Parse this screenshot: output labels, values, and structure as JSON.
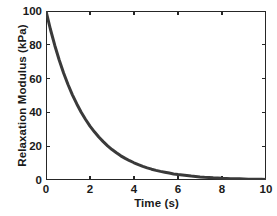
{
  "chart_data": {
    "type": "line",
    "title": "",
    "subtitle": "",
    "xlabel": "Time (s)",
    "ylabel": "Relaxation Modulus (kPa)",
    "xlim": [
      0,
      10
    ],
    "ylim": [
      0,
      100
    ],
    "xticks": [
      0,
      2,
      4,
      6,
      8,
      10
    ],
    "yticks": [
      0,
      20,
      40,
      60,
      80,
      100
    ],
    "xtick_labels": [
      "0",
      "2",
      "4",
      "6",
      "8",
      "10"
    ],
    "ytick_labels": [
      "0",
      "20",
      "40",
      "60",
      "80",
      "100"
    ],
    "grid": false,
    "legend": null,
    "legend_position": "none",
    "annotations": [],
    "series": [
      {
        "name": "Relaxation Modulus",
        "color": "#3a3a3a",
        "line_width": 3.0,
        "style": "solid",
        "x": [
          0.0,
          0.2,
          0.4,
          0.6,
          0.8,
          1.0,
          1.2,
          1.4,
          1.6,
          1.8,
          2.0,
          2.2,
          2.4,
          2.6,
          2.8,
          3.0,
          3.2,
          3.4,
          3.6,
          3.8,
          4.0,
          4.2,
          4.4,
          4.6,
          4.8,
          5.0,
          5.2,
          5.4,
          5.6,
          5.8,
          6.0,
          6.2,
          6.4,
          6.6,
          6.8,
          7.0,
          7.2,
          7.4,
          7.6,
          7.8,
          8.0,
          8.2,
          8.4,
          8.6,
          8.8,
          9.0,
          9.2,
          9.4,
          9.6,
          9.8,
          10.0
        ],
        "y": [
          100.0,
          89.2,
          79.6,
          71.0,
          63.3,
          56.5,
          50.4,
          45.0,
          40.1,
          35.8,
          31.9,
          28.5,
          25.4,
          22.7,
          20.2,
          18.0,
          16.1,
          14.3,
          12.8,
          11.4,
          10.2,
          9.1,
          8.1,
          7.2,
          6.4,
          5.7,
          5.1,
          4.6,
          4.1,
          3.6,
          3.2,
          2.9,
          2.6,
          2.3,
          2.1,
          1.8,
          1.6,
          1.5,
          1.3,
          1.2,
          1.0,
          0.9,
          0.8,
          0.7,
          0.7,
          0.6,
          0.5,
          0.5,
          0.4,
          0.4,
          0.3
        ]
      }
    ]
  },
  "figure": {
    "background_color": "#ffffff",
    "axes_color": "#262626",
    "text_color": "#1a1a1a"
  }
}
